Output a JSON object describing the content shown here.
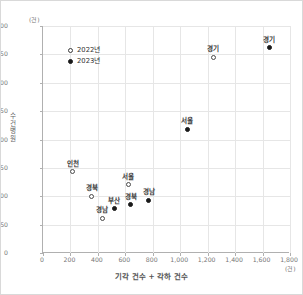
{
  "chart_data": {
    "type": "scatter",
    "title": "",
    "xlabel": "기각 건수 + 각하 건수",
    "ylabel": "수건 병원",
    "x_unit": "(건)",
    "y_unit": "(건)",
    "xlim": [
      0,
      1800
    ],
    "ylim": [
      0,
      400
    ],
    "xticks": [
      "0",
      "200",
      "400",
      "600",
      "800",
      "1,000",
      "1,200",
      "1,400",
      "1,600",
      "1,800"
    ],
    "xtick_values": [
      0,
      200,
      400,
      600,
      800,
      1000,
      1200,
      1400,
      1600,
      1800
    ],
    "yticks": [
      "0",
      "50",
      "100",
      "150",
      "200",
      "250",
      "300",
      "350",
      "400"
    ],
    "ytick_values": [
      0,
      50,
      100,
      150,
      200,
      250,
      300,
      350,
      400
    ],
    "grid": true,
    "legend_position": "top-left",
    "legend": [
      {
        "label": "2022년",
        "marker": "open-circle"
      },
      {
        "label": "2023년",
        "marker": "filled-circle"
      }
    ],
    "series": [
      {
        "name": "2022년",
        "marker": "open-circle",
        "points": [
          {
            "label": "인천",
            "x": 215,
            "y": 143
          },
          {
            "label": "경북",
            "x": 355,
            "y": 100
          },
          {
            "label": "경남",
            "x": 430,
            "y": 61
          },
          {
            "label": "서울",
            "x": 620,
            "y": 120
          },
          {
            "label": "경기",
            "x": 1240,
            "y": 345
          }
        ]
      },
      {
        "name": "2023년",
        "marker": "filled-circle",
        "points": [
          {
            "label": "부산",
            "x": 520,
            "y": 78
          },
          {
            "label": "경북",
            "x": 640,
            "y": 85
          },
          {
            "label": "경남",
            "x": 770,
            "y": 93
          },
          {
            "label": "서울",
            "x": 1050,
            "y": 218
          },
          {
            "label": "경기",
            "x": 1650,
            "y": 362
          }
        ]
      }
    ]
  }
}
